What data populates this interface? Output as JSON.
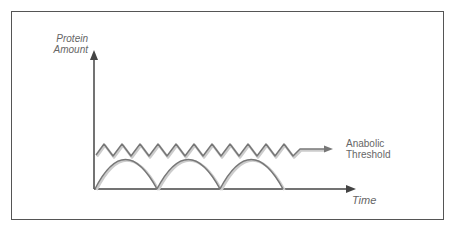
{
  "diagram": {
    "y_axis_label_line1": "Protein",
    "y_axis_label_line2": "Amount",
    "x_axis_label": "Time",
    "threshold_label_line1": "Anabolic",
    "threshold_label_line2": "Threshold",
    "colors": {
      "axis": "#444444",
      "curve": "#777777",
      "text": "#666666",
      "frame": "#555555"
    }
  }
}
